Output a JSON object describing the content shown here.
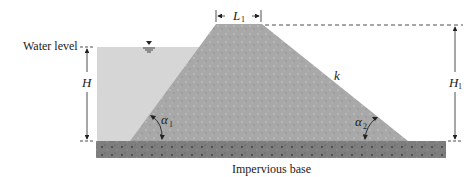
{
  "labels": {
    "water_level": "Water level",
    "impervious_base": "Impervious base",
    "crest_width": "L",
    "crest_width_sub": "1",
    "water_height": "H",
    "dam_height": "H",
    "dam_height_sub": "1",
    "permeability": "k",
    "alpha1": "α",
    "alpha1_sub": "1",
    "alpha2": "α",
    "alpha2_sub": "2"
  },
  "colors": {
    "water": "#d4d4d4",
    "dam": "#a9a9a9",
    "base": "#7d7d7d",
    "lines": "#222222"
  },
  "symbols": {
    "water_surface": "water-surface-symbol"
  }
}
